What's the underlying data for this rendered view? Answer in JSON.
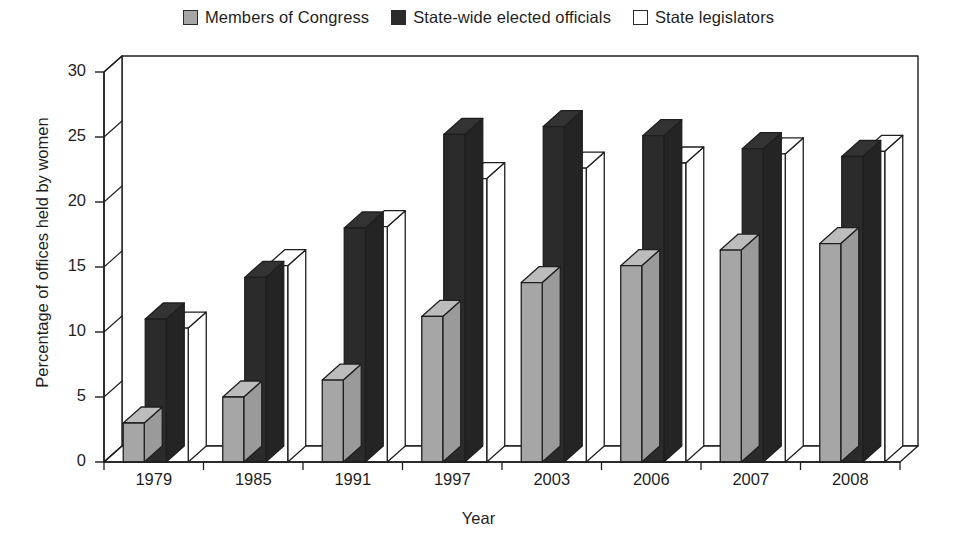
{
  "chart_data": {
    "type": "bar",
    "title": "",
    "xlabel": "Year",
    "ylabel": "Percentage of offices held by women",
    "categories": [
      "1979",
      "1985",
      "1991",
      "1997",
      "2003",
      "2006",
      "2007",
      "2008"
    ],
    "ylim": [
      0,
      30
    ],
    "yticks": [
      0,
      5,
      10,
      15,
      20,
      25,
      30
    ],
    "grid": false,
    "legend_position": "top-center",
    "style": "3d-grouped-bars",
    "series": [
      {
        "name": "Members of Congress",
        "color": "#a6a6a6",
        "values": [
          3.0,
          5.0,
          6.3,
          11.2,
          13.8,
          15.1,
          16.3,
          16.8
        ]
      },
      {
        "name": "State-wide elected officials",
        "color": "#2b2b2b",
        "values": [
          11.0,
          14.2,
          18.0,
          25.2,
          25.8,
          25.1,
          24.1,
          23.5
        ]
      },
      {
        "name": "State legislators",
        "color": "#ffffff",
        "values": [
          10.3,
          15.1,
          18.1,
          21.8,
          22.6,
          23.0,
          23.7,
          23.9
        ]
      }
    ]
  },
  "legend": {
    "items": [
      {
        "label": "Members of Congress",
        "swatch": "gray"
      },
      {
        "label": "State-wide elected officials",
        "swatch": "black"
      },
      {
        "label": "State legislators",
        "swatch": "white"
      }
    ]
  },
  "axes": {
    "y_title": "Percentage of offices held by women",
    "x_title": "Year",
    "y_ticks": [
      "0",
      "5",
      "10",
      "15",
      "20",
      "25",
      "30"
    ],
    "x_ticks": [
      "1979",
      "1985",
      "1991",
      "1997",
      "2003",
      "2006",
      "2007",
      "2008"
    ]
  }
}
